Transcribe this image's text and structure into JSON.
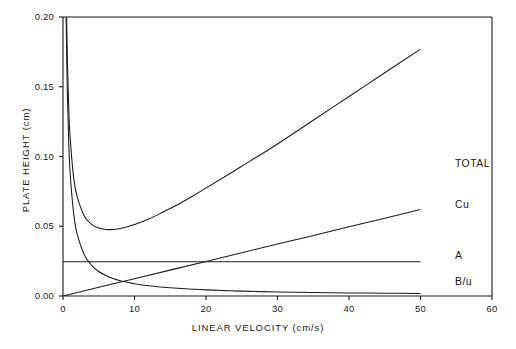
{
  "chart_data": {
    "type": "line",
    "title": "",
    "xlabel": "LINEAR VELOCITY  (cm/s)",
    "ylabel": "PLATE HEIGHT  (cm)",
    "xlim": [
      0,
      60
    ],
    "ylim": [
      0.0,
      0.2
    ],
    "xticks": [
      "0",
      "10",
      "20",
      "30",
      "40",
      "50",
      "60"
    ],
    "xtick_values": [
      0,
      10,
      20,
      30,
      40,
      50,
      60
    ],
    "yticks": [
      "0.00",
      "0.05",
      "0.10",
      "0.15",
      "0.20"
    ],
    "ytick_values": [
      0.0,
      0.05,
      0.1,
      0.15,
      0.2
    ],
    "grid": false,
    "legend_position": "inline-right-of-curves",
    "equation": "H = A + B/u + Cu",
    "coefficients": {
      "A": 0.0245,
      "B": 0.088,
      "C": 0.00124
    },
    "series": [
      {
        "name": "TOTAL",
        "label": "TOTAL",
        "color": "#1a1a1a",
        "description": "Van Deemter total plate height A + B/u + Cu",
        "x": [
          0.44,
          0.6,
          0.8,
          1.0,
          1.5,
          2,
          3,
          4,
          5,
          6,
          7,
          8,
          9,
          10,
          12,
          14,
          16,
          18,
          20,
          25,
          30,
          35,
          40,
          45,
          50
        ],
        "y": [
          0.2249,
          0.1717,
          0.1355,
          0.1137,
          0.0843,
          0.0709,
          0.0572,
          0.0514,
          0.0487,
          0.0477,
          0.0477,
          0.0484,
          0.0496,
          0.0512,
          0.0552,
          0.0602,
          0.0654,
          0.0712,
          0.0773,
          0.093,
          0.109,
          0.126,
          0.143,
          0.16,
          0.177
        ]
      },
      {
        "name": "Cu",
        "label": "Cu",
        "color": "#1a1a1a",
        "description": "Mass-transfer term, linear in velocity",
        "x": [
          0,
          10,
          20,
          30,
          40,
          50
        ],
        "y": [
          0.0,
          0.0124,
          0.0248,
          0.0372,
          0.0496,
          0.062
        ]
      },
      {
        "name": "A",
        "label": "A",
        "color": "#1a1a1a",
        "description": "Eddy diffusion term, constant",
        "x": [
          0,
          50
        ],
        "y": [
          0.0245,
          0.0245
        ]
      },
      {
        "name": "B/u",
        "label": "B/u",
        "color": "#1a1a1a",
        "description": "Longitudinal diffusion term, inversely proportional to velocity",
        "x": [
          0.44,
          0.6,
          0.8,
          1.0,
          1.5,
          2,
          3,
          4,
          5,
          6,
          7,
          8,
          9,
          10,
          12,
          14,
          16,
          18,
          20,
          25,
          30,
          35,
          40,
          45,
          50
        ],
        "y": [
          0.2,
          0.1467,
          0.11,
          0.088,
          0.0587,
          0.044,
          0.0293,
          0.022,
          0.0176,
          0.0147,
          0.0126,
          0.011,
          0.0098,
          0.0088,
          0.0073,
          0.0063,
          0.0055,
          0.0049,
          0.0044,
          0.0035,
          0.0029,
          0.0025,
          0.0022,
          0.002,
          0.0018
        ]
      }
    ],
    "curve_labels": [
      {
        "text": "TOTAL",
        "x": 455,
        "y": 164
      },
      {
        "text": "Cu",
        "x": 455,
        "y": 205
      },
      {
        "text": "A",
        "x": 455,
        "y": 256
      },
      {
        "text": "B/u",
        "x": 455,
        "y": 282
      }
    ]
  }
}
